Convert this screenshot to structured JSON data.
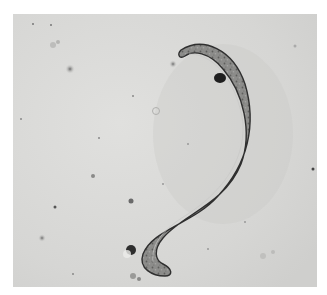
{
  "image": {
    "subject": "nematode worm under light microscope",
    "style": "grayscale brightfield micrograph",
    "colors": {
      "page_background": "#ffffff",
      "field_background": "#d9d9d7",
      "worm_body": "#8a8a88",
      "worm_outline": "#3a3a3a",
      "debris": "#4a4a4a"
    }
  }
}
